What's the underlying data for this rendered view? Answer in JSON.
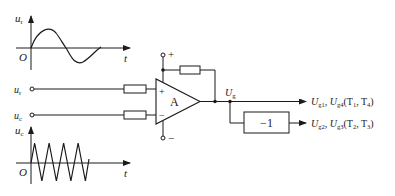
{
  "diagram": {
    "sine_graph": {
      "y_label": "u",
      "y_label_sub": "r",
      "origin_label": "O",
      "x_label": "t"
    },
    "triangle_graph": {
      "y_label": "u",
      "y_label_sub": "c",
      "origin_label": "O",
      "x_label": "t",
      "cycles": 4
    },
    "inputs": {
      "ur_label": "u",
      "ur_sub": "r",
      "uc_label": "u",
      "uc_sub": "c"
    },
    "opamp": {
      "label": "A",
      "plus_input": "+",
      "minus_input": "−",
      "supply_pos": "+",
      "supply_neg": "−"
    },
    "output_node": {
      "label": "U",
      "sub": "g"
    },
    "inverter": {
      "label": "−1"
    },
    "outputs": [
      {
        "u1": "U",
        "u1_sub": "g1",
        "sep": ", ",
        "u2": "U",
        "u2_sub": "g4",
        "tail": "(T",
        "t1_sub": "1",
        "mid": ", T",
        "t2_sub": "4",
        "close": ")"
      },
      {
        "u1": "U",
        "u1_sub": "g2",
        "sep": ", ",
        "u2": "U",
        "u2_sub": "g3",
        "tail": "(T",
        "t1_sub": "2",
        "mid": ", T",
        "t2_sub": "3",
        "close": ")"
      }
    ]
  }
}
